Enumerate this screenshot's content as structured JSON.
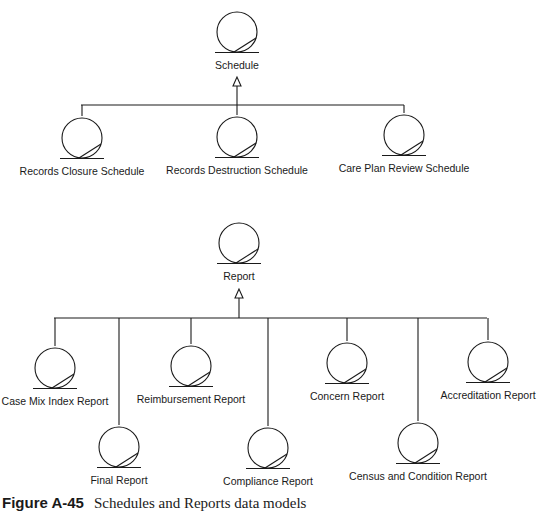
{
  "diagram": {
    "type": "class hierarchy (data model)",
    "stroke_color": "#1a1a1a",
    "background": "#ffffff",
    "groups": [
      {
        "name": "schedule",
        "parent": {
          "label": "Schedule",
          "cx": 237,
          "cy": 32
        },
        "bus_y": 105,
        "bus_x": [
          81,
          404
        ],
        "arrow": {
          "x": 237,
          "tip_y": 77
        },
        "children": [
          {
            "label": "Records Closure Schedule",
            "cx": 82,
            "cy": 138,
            "stem_top": 105
          },
          {
            "label": "Records Destruction Schedule",
            "cx": 237,
            "cy": 137,
            "stem_top": 105
          },
          {
            "label": "Care Plan Review Schedule",
            "cx": 404,
            "cy": 135,
            "stem_top": 103
          }
        ]
      },
      {
        "name": "report",
        "parent": {
          "label": "Report",
          "cx": 239,
          "cy": 243
        },
        "bus_y": 318,
        "bus_x": [
          54,
          487
        ],
        "arrow": {
          "x": 239,
          "tip_y": 289
        },
        "children": [
          {
            "label": "Case Mix Index Report",
            "cx": 55,
            "cy": 368,
            "stem_top": 319
          },
          {
            "label": "Final Report",
            "cx": 119,
            "cy": 447,
            "stem_top": 319
          },
          {
            "label": "Reimbursement Report",
            "cx": 191,
            "cy": 366,
            "stem_top": 318
          },
          {
            "label": "Compliance Report",
            "cx": 268,
            "cy": 448,
            "stem_top": 318
          },
          {
            "label": "Concern Report",
            "cx": 347,
            "cy": 363,
            "stem_top": 317
          },
          {
            "label": "Census and Condition Report",
            "cx": 418,
            "cy": 443,
            "stem_top": 316
          },
          {
            "label": "Accreditation Report",
            "cx": 488,
            "cy": 362,
            "stem_top": 314
          }
        ]
      }
    ]
  },
  "caption": {
    "number": "Figure A-45",
    "text": "Schedules and Reports data models"
  }
}
